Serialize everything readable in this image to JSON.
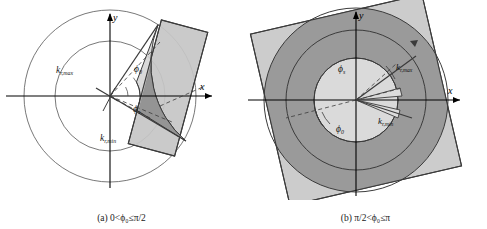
{
  "figure": {
    "type": "geometry-diagram",
    "panels": [
      {
        "id": "a",
        "caption_prefix": "(a)",
        "caption": "0<ϕ₀≤π/2",
        "caption_full": "(a)  0<ϕ₀≤π/2",
        "axes": {
          "x_label": "x",
          "y_label": "y"
        },
        "labels": {
          "k_max": "k",
          "k_max_sub": "r,max",
          "k_min": "k",
          "k_min_sub": "r,min",
          "phi_zero": "ϕ",
          "phi_zero_sub": "0",
          "phi_s": "ϕ",
          "phi_s_sub": "s"
        },
        "circles": [
          {
            "name": "outer-circle",
            "r": 86
          },
          {
            "name": "inner-circle",
            "r": 55
          }
        ],
        "sector": {
          "r_inner": 30,
          "r_outer": 86,
          "start_deg": -28,
          "end_deg": 56
        },
        "rect": {
          "rotation_deg": 15,
          "w": 46,
          "h": 124
        }
      },
      {
        "id": "b",
        "caption_prefix": "(b)",
        "caption": "π/2<ϕ₀≤π",
        "caption_full": "(b)  π/2<ϕ₀≤π",
        "axes": {
          "x_label": "x",
          "y_label": "y"
        },
        "labels": {
          "k_max": "k",
          "k_max_sub": "r,max",
          "k_min": "k",
          "k_min_sub": "r,min",
          "phi_zero": "ϕ",
          "phi_zero_sub": "0",
          "phi_s": "ϕ",
          "phi_s_sub": "s"
        },
        "circles": [
          {
            "name": "outer-circle",
            "r": 92
          },
          {
            "name": "mid-circle",
            "r": 70
          },
          {
            "name": "inner-circle",
            "r": 42
          }
        ],
        "sector": {
          "r_inner": 42,
          "r_outer": 92,
          "start_deg": 12,
          "end_deg": 340
        },
        "rect": {
          "rotation_deg": -13,
          "w": 176,
          "h": 176
        }
      }
    ],
    "colors": {
      "dark_fill": "#969696",
      "light_fill": "#c6c6c6",
      "mid_fill": "#b4b4b4",
      "pale_fill": "#d9d9d9",
      "stroke": "#3b3b3b",
      "axis": "#000000",
      "text": "#1a1a1a"
    }
  }
}
